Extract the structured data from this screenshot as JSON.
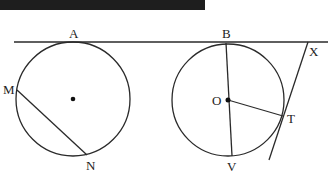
{
  "diagram": {
    "labels": {
      "A": "A",
      "B": "B",
      "X": "X",
      "M": "M",
      "N": "N",
      "O": "O",
      "T": "T",
      "V": "V"
    },
    "line_color": "#2a2a2a",
    "top_bar_color": "#1e1e1e"
  }
}
